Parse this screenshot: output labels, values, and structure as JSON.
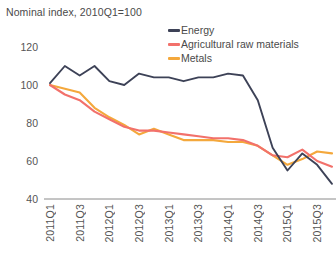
{
  "chart_data": {
    "type": "line",
    "title": "Nominal index, 2010Q1=100",
    "xlabel": "",
    "ylabel": "",
    "ylim": [
      40,
      120
    ],
    "yticks": [
      120,
      100,
      80,
      60,
      40
    ],
    "grid": false,
    "legend_position": "top-right",
    "x": [
      "2011Q1",
      "2011Q2",
      "2011Q3",
      "2011Q4",
      "2012Q1",
      "2012Q2",
      "2012Q3",
      "2012Q4",
      "2013Q1",
      "2013Q2",
      "2013Q3",
      "2013Q4",
      "2014Q1",
      "2014Q2",
      "2014Q3",
      "2014Q4",
      "2015Q1",
      "2015Q2",
      "2015Q3",
      "2015Q4"
    ],
    "xticks": [
      "2011Q1",
      "2011Q3",
      "2012Q1",
      "2012Q3",
      "2013Q1",
      "2013Q3",
      "2014Q1",
      "2014Q3",
      "2015Q1",
      "2015Q3"
    ],
    "series": [
      {
        "name": "Energy",
        "color": "#3d4257",
        "values": [
          101,
          110,
          105,
          110,
          102,
          100,
          106,
          104,
          104,
          102,
          104,
          104,
          106,
          105,
          92,
          67,
          55,
          64,
          58,
          48
        ]
      },
      {
        "name": "Agricultural raw materials",
        "color": "#f2716b",
        "values": [
          100,
          95,
          92,
          86,
          82,
          78,
          76,
          76,
          75,
          74,
          73,
          72,
          72,
          71,
          68,
          63,
          62,
          66,
          60,
          57
        ]
      },
      {
        "name": "Metals",
        "color": "#f4a83c",
        "values": [
          100,
          98,
          96,
          88,
          83,
          79,
          74,
          77,
          74,
          71,
          71,
          71,
          70,
          70,
          68,
          63,
          58,
          61,
          65,
          64
        ]
      }
    ]
  },
  "legend": {
    "items": [
      {
        "label": "Energy"
      },
      {
        "label": "Agricultural raw materials"
      },
      {
        "label": "Metals"
      }
    ]
  }
}
